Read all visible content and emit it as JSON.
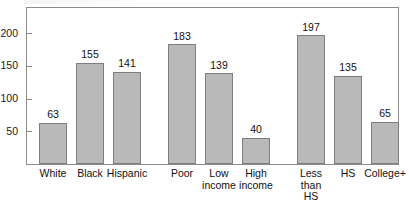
{
  "chart_data": {
    "type": "bar",
    "title": "",
    "subtitle": "",
    "xlabel": "",
    "ylabel": "",
    "ylim": [
      0,
      229
    ],
    "grid": false,
    "legend": null,
    "y_ticks": [
      {
        "label": "200",
        "value": 200
      },
      {
        "label": "150",
        "value": 150
      },
      {
        "label": "100",
        "value": 100
      },
      {
        "label": "50",
        "value": 50
      }
    ],
    "categories": [
      "White",
      "Black",
      "Hispanic",
      "Poor",
      "Low\nincome",
      "High\nincome",
      "Less\nthan\nHS",
      "HS",
      "College+"
    ],
    "values": [
      63,
      155,
      141,
      183,
      139,
      40,
      197,
      135,
      65
    ],
    "bars": [
      {
        "label": "White",
        "value": 63,
        "value_label": "63",
        "group": "race"
      },
      {
        "label": "Black",
        "value": 155,
        "value_label": "155",
        "group": "race"
      },
      {
        "label": "Hispanic",
        "value": 141,
        "value_label": "141",
        "group": "race"
      },
      {
        "label": "Poor",
        "value": 183,
        "value_label": "183",
        "group": "income"
      },
      {
        "label": "Low\nincome",
        "value": 139,
        "value_label": "139",
        "group": "income"
      },
      {
        "label": "High\nincome",
        "value": 40,
        "value_label": "40",
        "group": "income"
      },
      {
        "label": "Less\nthan\nHS",
        "value": 197,
        "value_label": "197",
        "group": "education"
      },
      {
        "label": "HS",
        "value": 135,
        "value_label": "135",
        "group": "education"
      },
      {
        "label": "College+",
        "value": 65,
        "value_label": "65",
        "group": "education"
      }
    ],
    "groups": [
      "race",
      "income",
      "education"
    ],
    "colors": {
      "bar_fill": "#b9b9b9",
      "bar_border": "#7e7e7e",
      "frame": "#8c8c8c",
      "text": "#111111",
      "background": "#ffffff"
    }
  }
}
